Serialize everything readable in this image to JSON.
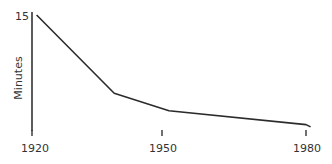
{
  "chart_data": {
    "type": "line",
    "title": "",
    "xlabel": "",
    "ylabel": "Minutes",
    "x_ticks": [
      "1920",
      "1950",
      "1980"
    ],
    "y_ticks": [
      "15"
    ],
    "xlim": [
      1920,
      1982
    ],
    "ylim": [
      0,
      15
    ],
    "grid": false,
    "legend": null,
    "series": [
      {
        "name": "Minutes",
        "x": [
          1921,
          1938,
          1950,
          1980,
          1981
        ],
        "values": [
          15,
          4.8,
          2.5,
          0.7,
          0.4
        ]
      }
    ],
    "colors": {
      "line": "#2b2b2b",
      "axis": "#333333",
      "text": "#333333"
    }
  }
}
